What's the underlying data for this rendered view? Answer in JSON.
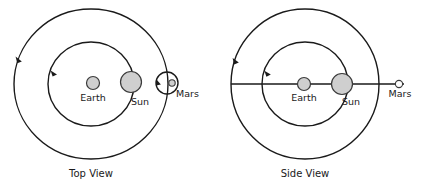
{
  "figure": {
    "title": "",
    "background_color": "#ffffff",
    "stroke_color": "#1a1a1a",
    "body_fill_color": "#cfcfcf",
    "width": 428,
    "height": 193
  },
  "panels": [
    {
      "id": "top-view",
      "caption": "Top View",
      "caption_x": 91,
      "caption_y": 176,
      "center": {
        "x": 91,
        "y": 84
      },
      "orbits": [
        {
          "name": "mars-orbit",
          "rx": 77,
          "ry": 75,
          "arrow_angle_deg": 196
        },
        {
          "name": "earth-orbit",
          "rx": 43,
          "ry": 42,
          "arrow_angle_deg": 199
        }
      ],
      "bodies": [
        {
          "name": "Earth",
          "label": "Earth",
          "cx": 93,
          "cy": 83,
          "r": 6.5,
          "label_x": 93,
          "label_y": 101
        },
        {
          "name": "Sun",
          "label": "Sun",
          "cx": 131,
          "cy": 82,
          "r": 10.5,
          "label_x": 140,
          "label_y": 105
        },
        {
          "name": "Mars",
          "label": "Mars",
          "cx": 172,
          "cy": 83,
          "r": 3.2,
          "label_x": 180,
          "label_y": 98
        }
      ],
      "mars_retrograde_loop": {
        "cx": 167,
        "cy": 83,
        "r": 11,
        "arrow_angle_deg": 185
      },
      "axis_line": null
    },
    {
      "id": "side-view",
      "caption": "Side View",
      "caption_x": 305,
      "caption_y": 176,
      "center": {
        "x": 305,
        "y": 84
      },
      "orbits": [
        {
          "name": "mars-orbit",
          "rx": 74,
          "ry": 75,
          "arrow_angle_deg": 199
        },
        {
          "name": "earth-orbit",
          "rx": 43,
          "ry": 42,
          "arrow_angle_deg": 201
        }
      ],
      "bodies": [
        {
          "name": "Earth",
          "label": "Earth",
          "cx": 304,
          "cy": 84,
          "r": 6.5,
          "label_x": 304,
          "label_y": 101
        },
        {
          "name": "Sun",
          "label": "Sun",
          "cx": 342,
          "cy": 84,
          "r": 10.5,
          "label_x": 351,
          "label_y": 105
        },
        {
          "name": "Mars",
          "label": "Mars",
          "cx": 399,
          "cy": 84,
          "r": 3.6,
          "label_x": 402,
          "label_y": 98
        }
      ],
      "mars_retrograde_loop": null,
      "axis_line": {
        "x1": 231,
        "y1": 84,
        "x2": 404,
        "y2": 84
      }
    }
  ]
}
